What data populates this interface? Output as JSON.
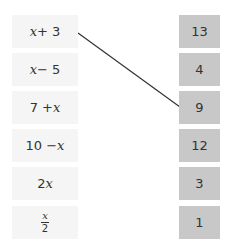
{
  "left_items": [
    {
      "pre": "",
      "var": "x",
      "post": " + 3"
    },
    {
      "pre": "",
      "var": "x",
      "post": " − 5"
    },
    {
      "pre": "7 + ",
      "var": "x",
      "post": ""
    },
    {
      "pre": "10 − ",
      "var": "x",
      "post": ""
    },
    {
      "pre": "2",
      "var": "x",
      "post": ""
    },
    {
      "frac_num": "x",
      "frac_den": "2"
    }
  ],
  "right_items": [
    "13",
    "4",
    "9",
    "12",
    "3",
    "1"
  ],
  "connections": [
    {
      "from": "x + 3",
      "to": "9"
    }
  ],
  "colors": {
    "left_box": "#f5f5f5",
    "right_box": "#c8c8c8",
    "line": "#333333"
  }
}
